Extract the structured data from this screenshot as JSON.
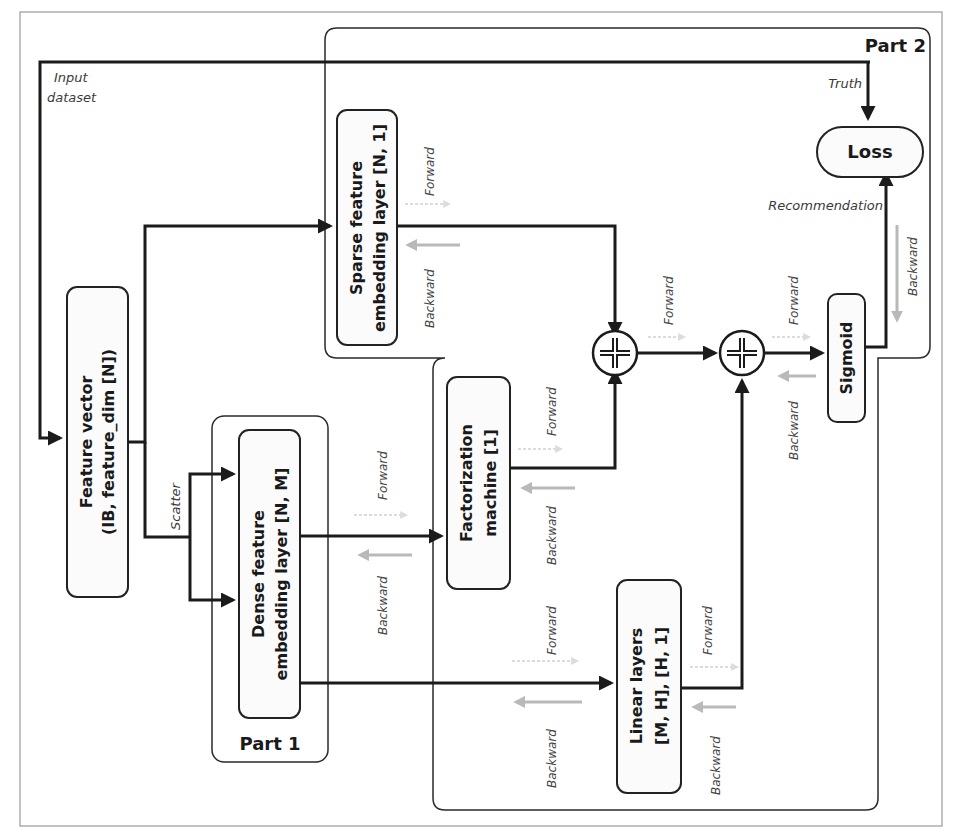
{
  "diagram": {
    "frame": {
      "border_color": "#9a9a9a"
    },
    "groups": {
      "part1": {
        "label": "Part 1"
      },
      "part2": {
        "label": "Part 2"
      }
    },
    "nodes": {
      "feature_vector": {
        "line1": "Feature vector",
        "line2": "(IB, feature_dim [N])"
      },
      "dense_embedding": {
        "line1": "Dense feature",
        "line2": "embedding layer [N, M]"
      },
      "sparse_embedding": {
        "line1": "Sparse feature",
        "line2": "embedding layer [N, 1]"
      },
      "factorization_machine": {
        "line1": "Factorization",
        "line2": "machine [1]"
      },
      "linear_layers": {
        "line1": "Linear layers",
        "line2": "[M, H], [H, 1]"
      },
      "sigmoid": {
        "label": "Sigmoid"
      },
      "loss": {
        "label": "Loss"
      },
      "sum1": {
        "symbol": "+"
      },
      "sum2": {
        "symbol": "+"
      }
    },
    "edge_labels": {
      "input_dataset_1": "Input",
      "input_dataset_2": "dataset",
      "truth": "Truth",
      "recommendation": "Recommendation",
      "scatter": "Scatter",
      "forward": "Forward",
      "backward": "Backward"
    },
    "colors": {
      "line": "#1b1b1b",
      "backward_arrow": "#b9b9b9",
      "forward_arrow": "#dcdcdc",
      "box_fill": "#fbfbfb"
    }
  }
}
